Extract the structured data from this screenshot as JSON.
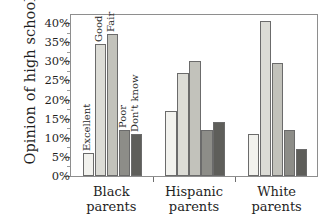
{
  "chart_data": {
    "type": "bar",
    "title": "",
    "xlabel": "",
    "ylabel": "Opinion of high schools",
    "ylim": [
      0,
      40
    ],
    "ytick_labels": [
      "0%",
      "5%",
      "10%",
      "15%",
      "20%",
      "25%",
      "30%",
      "35%",
      "40%"
    ],
    "ytick_values": [
      0,
      5,
      10,
      15,
      20,
      25,
      30,
      35,
      40
    ],
    "grid": false,
    "legend_position": "in-bar-rotated-labels-first-group",
    "categories": [
      "Black\nparents",
      "Hispanic\nparents",
      "White\nparents"
    ],
    "category_lines": [
      [
        "Black",
        "parents"
      ],
      [
        "Hispanic",
        "parents"
      ],
      [
        "White",
        "parents"
      ]
    ],
    "series": [
      {
        "name": "Excellent",
        "color": "#f2f2ee",
        "values": [
          6,
          17,
          11
        ]
      },
      {
        "name": "Good",
        "color": "#dcdcd6",
        "values": [
          34.5,
          27,
          40.5
        ]
      },
      {
        "name": "Fair",
        "color": "#c2c2bb",
        "values": [
          37,
          30,
          29.5
        ]
      },
      {
        "name": "Poor",
        "color": "#8d8d88",
        "values": [
          12,
          12,
          12
        ]
      },
      {
        "name": "Don't know",
        "color": "#5e5e5a",
        "values": [
          11,
          14,
          7
        ]
      }
    ],
    "bar_labels_first_group": [
      "Excellent",
      "Good",
      "Fair",
      "Poor",
      "Don't know"
    ]
  },
  "axis": {
    "y_title": "Opinion of high schools"
  }
}
